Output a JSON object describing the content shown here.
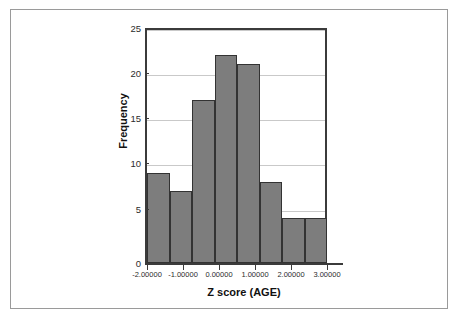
{
  "figure": {
    "background_color": "#ffffff",
    "frame_color": "#9a9a9a"
  },
  "chart_data": {
    "type": "bar",
    "title": "",
    "subtitle": "",
    "xlabel": "Z score (AGE)",
    "ylabel": "Frequency",
    "xlim": [
      -2.5,
      3.0
    ],
    "ylim": [
      0,
      26
    ],
    "grid": true,
    "legend": null,
    "bar_color": "#7d7d7d",
    "bar_edge_color": "#333333",
    "x_tick_labels": [
      "-2.00000",
      "-1.00000",
      "0.00000",
      "1.00000",
      "2.00000",
      "3.00000"
    ],
    "x_tick_values": [
      -2,
      -1,
      0,
      1,
      2,
      3
    ],
    "y_tick_labels": [
      "0",
      "5",
      "10",
      "15",
      "20",
      "25"
    ],
    "y_tick_values": [
      0,
      5,
      10,
      15,
      20,
      25
    ],
    "bin_width": 0.5,
    "bin_edges": [
      -2.5,
      -2.0,
      -1.5,
      -1.0,
      -0.5,
      0.0,
      0.5,
      1.0,
      1.5
    ],
    "categories": [
      "-2.5 to -2.0",
      "-2.0 to -1.5",
      "-1.5 to -1.0",
      "-1.0 to -0.5",
      "-0.5 to 0.0",
      "0.0 to 0.5",
      "0.5 to 1.0",
      "1.0 to 1.5"
    ],
    "values": [
      10,
      8,
      18,
      23,
      22,
      9,
      5,
      5
    ],
    "bars": [
      {
        "label": "-2.5 to -2.0",
        "x_left": -2.5,
        "x_right": -2.0,
        "value": 10
      },
      {
        "label": "-2.0 to -1.5",
        "x_left": -2.0,
        "x_right": -1.5,
        "value": 8
      },
      {
        "label": "-1.5 to -1.0",
        "x_left": -1.5,
        "x_right": -1.0,
        "value": 18
      },
      {
        "label": "-1.0 to -0.5",
        "x_left": -1.0,
        "x_right": -0.5,
        "value": 23
      },
      {
        "label": "-0.5 to 0.0",
        "x_left": -0.5,
        "x_right": 0.0,
        "value": 22
      },
      {
        "label": "0.0 to 0.5",
        "x_left": 0.0,
        "x_right": 0.5,
        "value": 9
      },
      {
        "label": "0.5 to 1.0",
        "x_left": 0.5,
        "x_right": 1.0,
        "value": 5
      },
      {
        "label": "1.0 to 1.5",
        "x_left": 1.0,
        "x_right": 1.5,
        "value": 5
      }
    ]
  }
}
